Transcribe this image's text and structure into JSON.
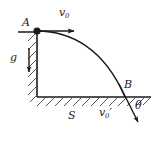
{
  "figure": {
    "width": 157,
    "height": 143,
    "background_color": "#ffffff",
    "stroke_color": "#1a1a1a",
    "labels": {
      "point_a": "A",
      "point_b": "B",
      "initial_velocity": "v",
      "initial_velocity_sub": "0",
      "gravity": "g",
      "distance": "S",
      "final_velocity": "v",
      "final_velocity_sub": "0",
      "final_velocity_prime": "′",
      "angle": "θ"
    },
    "geometry": {
      "launch_point": [
        37,
        31
      ],
      "landing_point": [
        125,
        97
      ],
      "corner_point": [
        37,
        97
      ],
      "ledge_start_x": 18,
      "ground_end_x": 151,
      "v0_arrow_end": [
        78,
        31
      ],
      "g_arrow_start": [
        29,
        48
      ],
      "g_arrow_end": [
        29,
        76
      ],
      "exit_arrow_end": [
        141,
        126
      ]
    }
  }
}
